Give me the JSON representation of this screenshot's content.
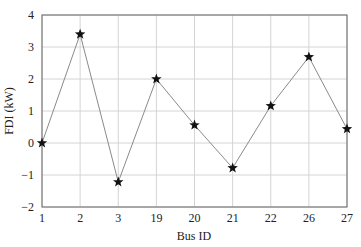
{
  "chart_data": {
    "type": "line",
    "title": "",
    "xlabel": "Bus ID",
    "ylabel": "FDI (kW)",
    "categories": [
      "1",
      "2",
      "3",
      "19",
      "20",
      "21",
      "22",
      "26",
      "27"
    ],
    "values": [
      0,
      3.4,
      -1.22,
      2.0,
      0.56,
      -0.78,
      1.16,
      2.69,
      0.44
    ],
    "ylim": [
      -2,
      4
    ],
    "yticks": [
      -2,
      -1,
      0,
      1,
      2,
      3,
      4
    ],
    "grid": true,
    "marker": "star",
    "line_color": "#8a8a8a",
    "marker_color": "#111111"
  }
}
